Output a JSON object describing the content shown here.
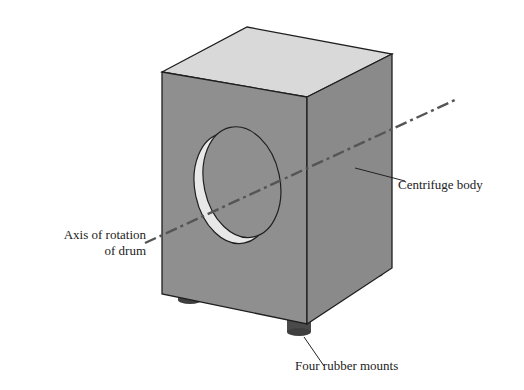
{
  "diagram": {
    "labels": {
      "axis_line1": "Axis of rotation",
      "axis_line2": "of drum",
      "body": "Centrifuge body",
      "mounts": "Four rubber mounts"
    },
    "colors": {
      "top_face": "#d9d9d9",
      "front_face": "#8f8f8f",
      "side_face": "#8a8a8a",
      "edge": "#1f1f1f",
      "mount": "#4a4a4a",
      "axis_line": "#555555",
      "drum_rim": "#e8e8e8"
    },
    "icons": [
      "cube-body",
      "drum-opening",
      "rubber-mount",
      "axis-dashdot-line"
    ]
  }
}
